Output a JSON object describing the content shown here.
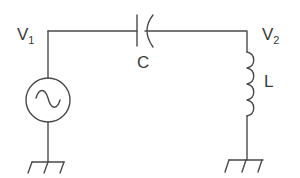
{
  "diagram": {
    "type": "circuit",
    "stroke_color": "#4a4a4a",
    "labels": {
      "v1_main": "V",
      "v1_sub": "1",
      "v2_main": "V",
      "v2_sub": "2",
      "capacitor": "C",
      "inductor": "L"
    },
    "components": [
      {
        "id": "source",
        "kind": "ac-voltage-source",
        "node_top": "V1",
        "node_bottom": "ground"
      },
      {
        "id": "C",
        "kind": "capacitor",
        "from": "V1",
        "to": "V2"
      },
      {
        "id": "L",
        "kind": "inductor",
        "from": "V2",
        "to": "ground"
      }
    ]
  }
}
